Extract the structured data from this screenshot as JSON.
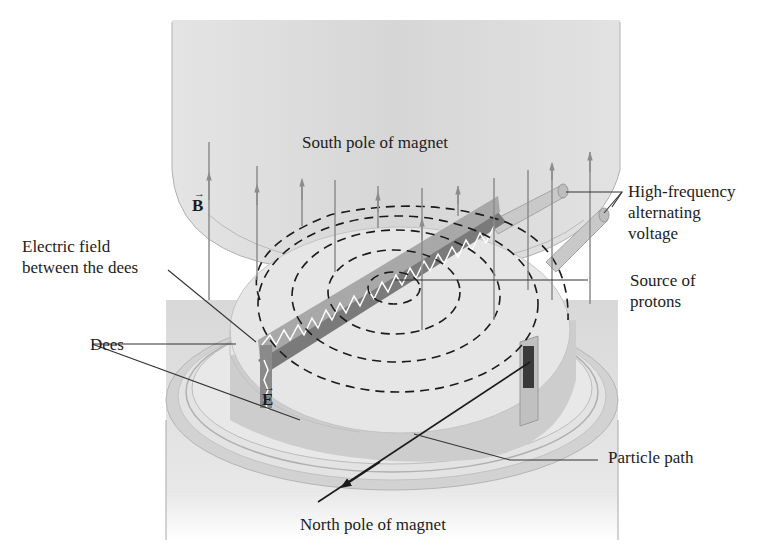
{
  "figure": {
    "labels": {
      "south_pole": "South pole of magnet",
      "north_pole": "North pole of magnet",
      "hf_voltage": [
        "High-frequency",
        "alternating",
        "voltage"
      ],
      "electric_field": [
        "Electric field",
        "between the dees"
      ],
      "source": [
        "Source of",
        "protons"
      ],
      "dees": "Dees",
      "particle_path": "Particle path",
      "b_vector": "B",
      "e_vector": "E",
      "vector_arrow": "→"
    },
    "colors": {
      "pole_fill": "#dcdcdc",
      "pole_edge": "#bdbdbd",
      "dee_top": "#e6e6e6",
      "dee_side": "#cfcfcf",
      "field_line": "#8c8c8c",
      "path": "#1a1a1a",
      "leader": "#333333",
      "text": "#1c1c1c"
    }
  }
}
